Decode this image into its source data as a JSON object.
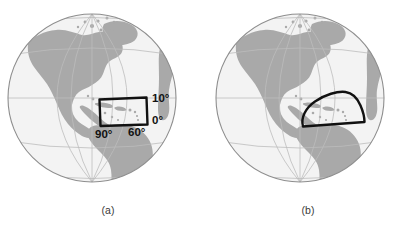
{
  "figure": {
    "type": "two-panel-globe-diagram",
    "background_color": "#ffffff",
    "width": 405,
    "height": 230
  },
  "style": {
    "ocean_color": "#f3f3f3",
    "land_color": "#a9a9a9",
    "graticule_color": "#bdbdbd",
    "rim_color": "#8e8e8e",
    "region_outline_color": "#111111",
    "label_color": "#111111",
    "caption_color": "#3a3a3a"
  },
  "panels": [
    {
      "id": "a",
      "caption": "(a)",
      "globe": {
        "center_x": 92,
        "center_y": 98,
        "radius": 84,
        "projection": "orthographic",
        "view_center_region": "Americas"
      },
      "region": {
        "name": "rectangular-domain",
        "shape": "quadrilateral",
        "description": "straight-sided latitude-longitude box over the Caribbean"
      },
      "labels": [
        {
          "name": "latitude-top-label",
          "text": "10°",
          "x": 153,
          "y": 101
        },
        {
          "name": "latitude-bottom-label",
          "text": "0°",
          "x": 153,
          "y": 123
        },
        {
          "name": "longitude-east-label",
          "text": "60°",
          "x": 129,
          "y": 134
        },
        {
          "name": "longitude-west-label",
          "text": "90°",
          "x": 98,
          "y": 136
        }
      ]
    },
    {
      "id": "b",
      "caption": "(b)",
      "globe": {
        "center_x": 300,
        "center_y": 98,
        "radius": 84,
        "projection": "orthographic",
        "view_center_region": "Americas"
      },
      "region": {
        "name": "curved-domain",
        "shape": "dome-arc",
        "description": "curved dome-shaped domain over the Caribbean with arched top and slanted base"
      },
      "labels": []
    }
  ],
  "captions": {
    "panel_a": {
      "text": "(a)",
      "x": 108,
      "y": 214
    },
    "panel_b": {
      "text": "(b)",
      "x": 308,
      "y": 214
    }
  }
}
